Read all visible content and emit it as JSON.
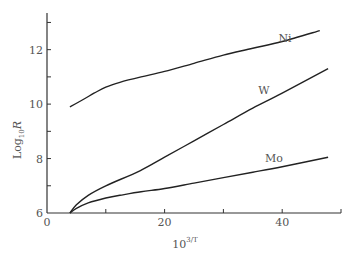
{
  "chart_data": {
    "type": "line",
    "title": "",
    "xlabel": "10^{3/T}",
    "xlabel_base": "10",
    "xlabel_exp": "3/T",
    "ylabel": "Log10 R",
    "ylabel_prefix": "Log",
    "ylabel_sub": "10",
    "ylabel_var": "R",
    "xlim": [
      0,
      50
    ],
    "ylim": [
      6,
      13.2
    ],
    "x_ticks": [
      0,
      20,
      40
    ],
    "x_minor_ticks": [
      10,
      30,
      50
    ],
    "y_ticks": [
      6,
      8,
      10,
      12
    ],
    "y_minor_ticks": [
      7,
      9,
      11,
      13
    ],
    "grid": false,
    "legend": "inline labels",
    "series": [
      {
        "name": "Ni",
        "x": [
          3.9,
          6,
          8,
          10,
          12.4,
          16,
          20,
          25,
          30,
          35,
          40,
          46.4
        ],
        "y": [
          9.9,
          10.15,
          10.4,
          10.62,
          10.8,
          11.0,
          11.2,
          11.5,
          11.8,
          12.05,
          12.3,
          12.7
        ]
      },
      {
        "name": "W",
        "x": [
          3.9,
          5,
          7,
          10,
          15.8,
          20,
          25,
          30,
          35,
          40,
          47.8
        ],
        "y": [
          6.0,
          6.3,
          6.65,
          7.0,
          7.55,
          8.05,
          8.65,
          9.25,
          9.85,
          10.4,
          11.3
        ]
      },
      {
        "name": "Mo",
        "x": [
          3.9,
          5,
          7,
          10,
          12.4,
          16,
          20,
          25,
          30,
          35,
          40,
          47.8
        ],
        "y": [
          6.0,
          6.17,
          6.37,
          6.55,
          6.65,
          6.78,
          6.9,
          7.1,
          7.3,
          7.5,
          7.7,
          8.05
        ]
      }
    ],
    "annotations": [
      {
        "text": "Ni",
        "series": "Ni"
      },
      {
        "text": "W",
        "series": "W"
      },
      {
        "text": "Mo",
        "series": "Mo"
      }
    ]
  }
}
